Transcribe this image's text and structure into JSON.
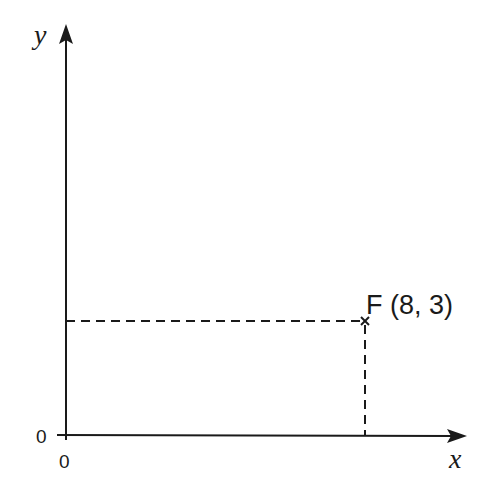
{
  "axes": {
    "x_label": "x",
    "y_label": "y",
    "x_origin_label": "0",
    "y_origin_label": "0"
  },
  "point": {
    "name": "F",
    "label": "F (8, 3)",
    "x": 8,
    "y": 3,
    "marker": "cross"
  },
  "colors": {
    "line": "#1a1a1a",
    "background": "#ffffff"
  }
}
